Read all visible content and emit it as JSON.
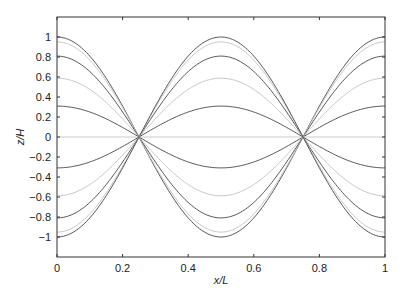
{
  "chart_data": {
    "type": "line",
    "title": "",
    "xlabel": "x/L",
    "ylabel": "z/H",
    "xlim": [
      0,
      1
    ],
    "ylim": [
      -1.2,
      1.2
    ],
    "grid": false,
    "legend": null,
    "xticks": [
      0,
      0.2,
      0.4,
      0.6,
      0.8,
      1
    ],
    "xtick_labels": [
      "0",
      "0.2",
      "0.4",
      "0.6",
      "0.8",
      "1"
    ],
    "yticks": [
      -1,
      -0.8,
      -0.6,
      -0.4,
      -0.2,
      0,
      0.2,
      0.4,
      0.6,
      0.8,
      1
    ],
    "ytick_labels": [
      "−1",
      "−0.8",
      "−0.6",
      "−0.4",
      "−0.2",
      "0",
      "0.2",
      "0.4",
      "0.6",
      "0.8",
      "1"
    ],
    "function": "z/H = A * cos(2*pi*x/L)",
    "series": [
      {
        "name": "A=1.000",
        "amplitude": 1.0,
        "color": "#555555"
      },
      {
        "name": "A=0.951",
        "amplitude": 0.951,
        "color": "#c8c8c8"
      },
      {
        "name": "A=0.809",
        "amplitude": 0.809,
        "color": "#555555"
      },
      {
        "name": "A=0.588",
        "amplitude": 0.588,
        "color": "#c8c8c8"
      },
      {
        "name": "A=0.309",
        "amplitude": 0.309,
        "color": "#555555"
      },
      {
        "name": "A=0.000",
        "amplitude": 0.0,
        "color": "#c8c8c8"
      },
      {
        "name": "A=-0.309",
        "amplitude": -0.309,
        "color": "#555555"
      },
      {
        "name": "A=-0.588",
        "amplitude": -0.588,
        "color": "#c8c8c8"
      },
      {
        "name": "A=-0.809",
        "amplitude": -0.809,
        "color": "#555555"
      },
      {
        "name": "A=-0.951",
        "amplitude": -0.951,
        "color": "#c8c8c8"
      },
      {
        "name": "A=-1.000",
        "amplitude": -1.0,
        "color": "#555555"
      }
    ],
    "nodes_x": [
      0.25,
      0.75
    ]
  },
  "axes": {
    "x_label": "x/L",
    "y_label": "z/H"
  }
}
